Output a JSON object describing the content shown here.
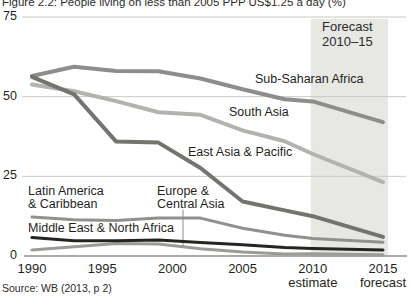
{
  "figure": {
    "title": "Figure 2.2: People living on less than 2005 PPP US$1.25 a day (%)",
    "source": "Source: WB (2013, p 2)"
  },
  "chart_data": {
    "type": "line",
    "title": "Figure 2.2: People living on less than 2005 PPP US$1.25 a day (%)",
    "xlabel": "",
    "ylabel": "% of population (shown in title)",
    "xlim": [
      1990,
      2015
    ],
    "ylim": [
      0,
      75
    ],
    "grid": true,
    "legend_position": "inline-labels",
    "x": [
      1990,
      1993,
      1996,
      1999,
      2002,
      2005,
      2008,
      2010,
      2015
    ],
    "y_ticks": [
      75,
      50,
      25,
      0
    ],
    "x_ticks": [
      {
        "year": 1990,
        "label": "1990",
        "sublabel": ""
      },
      {
        "year": 1995,
        "label": "1995",
        "sublabel": ""
      },
      {
        "year": 2000,
        "label": "2000",
        "sublabel": ""
      },
      {
        "year": 2005,
        "label": "2005",
        "sublabel": ""
      },
      {
        "year": 2010,
        "label": "2010",
        "sublabel": "estimate"
      },
      {
        "year": 2015,
        "label": "2015",
        "sublabel": "forecast"
      }
    ],
    "forecast_band": {
      "from": 2010,
      "to": 2015,
      "label": "Forecast\n2010–15",
      "color": "#e7e7e4"
    },
    "series": [
      {
        "name": "Sub-Saharan Africa",
        "slug": "sub-saharan-africa",
        "color": "#8d8d8b",
        "width": 4,
        "values": [
          56.5,
          59.4,
          58.1,
          58.0,
          55.7,
          52.3,
          49.2,
          48.5,
          42.0
        ],
        "label": {
          "text": "Sub-Saharan Africa",
          "x": 255,
          "y": 73
        }
      },
      {
        "name": "South Asia",
        "slug": "south-asia",
        "color": "#b2b2af",
        "width": 4,
        "values": [
          53.8,
          51.7,
          48.6,
          45.1,
          44.3,
          39.4,
          36.0,
          32.0,
          23.2
        ],
        "label": {
          "text": "South Asia",
          "x": 229,
          "y": 106
        }
      },
      {
        "name": "East Asia & Pacific",
        "slug": "east-asia-pacific",
        "color": "#73736f",
        "width": 4,
        "values": [
          56.2,
          50.7,
          35.9,
          35.6,
          27.6,
          17.1,
          14.3,
          12.5,
          6.0
        ],
        "label": {
          "text": "East Asia & Pacific",
          "x": 188,
          "y": 146
        }
      },
      {
        "name": "Latin America & Caribbean",
        "slug": "latin-america-caribbean",
        "color": "#90908d",
        "width": 3,
        "values": [
          12.2,
          11.4,
          11.1,
          11.9,
          11.9,
          8.7,
          6.5,
          5.5,
          4.3
        ],
        "label": {
          "text": "Latin America\n& Caribbean",
          "x": 28,
          "y": 185
        }
      },
      {
        "name": "Europe & Central Asia",
        "slug": "europe-central-asia",
        "color": "#9b9b98",
        "width": 3,
        "values": [
          1.9,
          2.9,
          3.9,
          3.8,
          2.3,
          1.3,
          0.6,
          0.7,
          0.4
        ],
        "label": {
          "text": "Europe &\nCentral Asia",
          "x": 157,
          "y": 185
        },
        "pointer": {
          "x": 183,
          "y1": 210,
          "y2": 246
        }
      },
      {
        "name": "Middle East & North Africa",
        "slug": "middle-east-north-africa",
        "color": "#242421",
        "width": 3,
        "values": [
          5.8,
          4.8,
          4.8,
          5.0,
          4.2,
          3.5,
          2.7,
          2.4,
          1.9
        ],
        "label": {
          "text": "Middle East & North Africa",
          "x": 28,
          "y": 222
        }
      }
    ]
  }
}
